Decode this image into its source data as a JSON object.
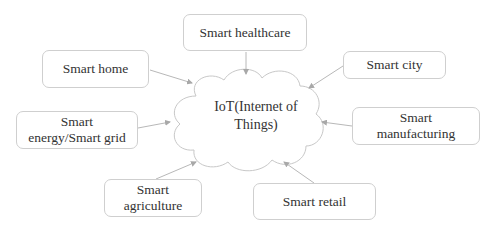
{
  "diagram": {
    "center": {
      "label": "IoT(Internet of\nThings)",
      "shape": "cloud"
    },
    "nodes": [
      {
        "id": "healthcare",
        "label": "Smart healthcare"
      },
      {
        "id": "home",
        "label": "Smart home"
      },
      {
        "id": "city",
        "label": "Smart city"
      },
      {
        "id": "energy",
        "label": "Smart\nenergy/Smart grid"
      },
      {
        "id": "manufacturing",
        "label": "Smart\nmanufacturing"
      },
      {
        "id": "agriculture",
        "label": "Smart\nagriculture"
      },
      {
        "id": "retail",
        "label": "Smart retail"
      }
    ],
    "edges": [
      {
        "from": "healthcare",
        "to": "center"
      },
      {
        "from": "home",
        "to": "center"
      },
      {
        "from": "city",
        "to": "center"
      },
      {
        "from": "energy",
        "to": "center"
      },
      {
        "from": "manufacturing",
        "to": "center"
      },
      {
        "from": "agriculture",
        "to": "center"
      },
      {
        "from": "retail",
        "to": "center"
      }
    ],
    "colors": {
      "border": "#cfcfcf",
      "arrow": "#b0b0b0",
      "text": "#333333"
    }
  }
}
